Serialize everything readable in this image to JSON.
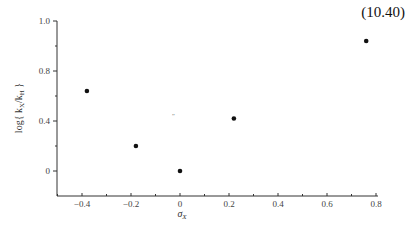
{
  "equation_number": "(10.40)",
  "caption_fragment": "",
  "chart_data": {
    "type": "scatter",
    "title": "",
    "xlabel": "σX",
    "ylabel": "log{kX/kH}",
    "x_ticks": [
      -0.4,
      -0.2,
      0,
      0.2,
      0.4,
      0.6,
      0.8
    ],
    "x_tick_labels": [
      "−0.4",
      "−0.2",
      "0",
      "0.2",
      "0.4",
      "0.6",
      "0.8"
    ],
    "y_tick_labels": [
      "1.0",
      "0.8",
      "0.4",
      "0"
    ],
    "xlim": [
      -0.5,
      0.8
    ],
    "ylim": [
      -0.2,
      1.0
    ],
    "grid": false,
    "legend": null,
    "series": [
      {
        "name": "data",
        "marker": "filled-circle",
        "points": [
          {
            "x": -0.38,
            "y": 0.64
          },
          {
            "x": -0.18,
            "y": 0.2
          },
          {
            "x": 0.0,
            "y": 0.0
          },
          {
            "x": 0.22,
            "y": 0.42
          },
          {
            "x": 0.76,
            "y": 0.92
          }
        ]
      }
    ]
  }
}
